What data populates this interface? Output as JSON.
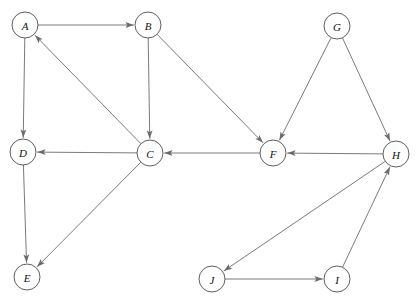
{
  "diagram": {
    "type": "directed-graph",
    "background_color": "#ffffff",
    "node_fill_color": "#ffffff",
    "node_stroke_color": "#4d4d4d",
    "edge_color": "#6b6b6b",
    "label_color": "#111111",
    "node_radius": 13,
    "nodes": [
      {
        "id": "A",
        "label": "A",
        "x": 25,
        "y": 25
      },
      {
        "id": "B",
        "label": "B",
        "x": 148,
        "y": 25
      },
      {
        "id": "C",
        "label": "C",
        "x": 150,
        "y": 153
      },
      {
        "id": "D",
        "label": "D",
        "x": 23,
        "y": 152
      },
      {
        "id": "E",
        "label": "E",
        "x": 27,
        "y": 277
      },
      {
        "id": "F",
        "label": "F",
        "x": 273,
        "y": 153
      },
      {
        "id": "G",
        "label": "G",
        "x": 337,
        "y": 26
      },
      {
        "id": "H",
        "label": "H",
        "x": 396,
        "y": 154
      },
      {
        "id": "I",
        "label": "I",
        "x": 337,
        "y": 279
      },
      {
        "id": "J",
        "label": "J",
        "x": 212,
        "y": 279
      }
    ],
    "edges": [
      {
        "from": "A",
        "to": "B",
        "directed": true
      },
      {
        "from": "A",
        "to": "D",
        "directed": true
      },
      {
        "from": "B",
        "to": "C",
        "directed": true
      },
      {
        "from": "B",
        "to": "F",
        "directed": true
      },
      {
        "from": "C",
        "to": "A",
        "directed": true
      },
      {
        "from": "C",
        "to": "D",
        "directed": true
      },
      {
        "from": "C",
        "to": "E",
        "directed": true
      },
      {
        "from": "D",
        "to": "E",
        "directed": true
      },
      {
        "from": "F",
        "to": "C",
        "directed": true
      },
      {
        "from": "G",
        "to": "F",
        "directed": true
      },
      {
        "from": "G",
        "to": "H",
        "directed": true
      },
      {
        "from": "H",
        "to": "F",
        "directed": true
      },
      {
        "from": "H",
        "to": "J",
        "directed": true
      },
      {
        "from": "I",
        "to": "H",
        "directed": true
      },
      {
        "from": "J",
        "to": "I",
        "directed": true
      }
    ]
  }
}
